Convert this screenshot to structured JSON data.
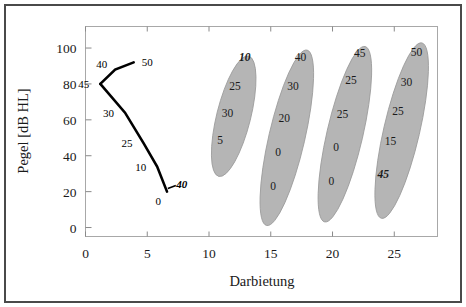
{
  "chart_data": {
    "type": "scatter",
    "title": "",
    "xlabel": "Darbietung",
    "ylabel": "Pegel [dB HL]",
    "xlim": [
      0,
      28.5
    ],
    "ylim": [
      -5,
      112
    ],
    "xticks": [
      0,
      5,
      10,
      15,
      20,
      25
    ],
    "xtick_labels": [
      "0",
      "5",
      "10",
      "15",
      "20",
      "25"
    ],
    "yticks": [
      0,
      20,
      40,
      60,
      80,
      100
    ],
    "ytick_labels": [
      "0",
      "20",
      "40",
      "60",
      "80",
      "100"
    ],
    "grid": false,
    "legend": "none",
    "series": [
      {
        "name": "connected-line",
        "type": "line",
        "marker": "none",
        "points": [
          {
            "x": 1.2,
            "y": 80,
            "label": "45",
            "label_pos": "left"
          },
          {
            "x": 2.4,
            "y": 88,
            "label": "40",
            "label_pos": "above-left"
          },
          {
            "x": 3.9,
            "y": 92,
            "label": "50",
            "label_pos": "right"
          }
        ]
      },
      {
        "name": "descending-line",
        "type": "line",
        "marker": "none",
        "points": [
          {
            "x": 1.2,
            "y": 80,
            "label": "45",
            "label_pos": "left"
          },
          {
            "x": 3.2,
            "y": 64,
            "label": "30",
            "label_pos": "left"
          },
          {
            "x": 4.7,
            "y": 47,
            "label": "25",
            "label_pos": "left"
          },
          {
            "x": 5.8,
            "y": 34,
            "label": "10",
            "label_pos": "left"
          },
          {
            "x": 6.6,
            "y": 20,
            "label": "0",
            "label_pos": "below-left"
          }
        ]
      }
    ],
    "annotations": [
      {
        "text": "40",
        "x": 7.8,
        "y": 24,
        "style": "bold-italic",
        "note": "tick mark right of final point of descending line"
      }
    ],
    "clusters": [
      {
        "name": "cluster-1",
        "center_x": 12.0,
        "center_y": 62,
        "labels": [
          {
            "text": "10",
            "x": 12.9,
            "y": 95,
            "style": "bold-italic"
          },
          {
            "text": "25",
            "x": 12.1,
            "y": 79,
            "style": "normal"
          },
          {
            "text": "30",
            "x": 11.5,
            "y": 64,
            "style": "normal"
          },
          {
            "text": "5",
            "x": 10.9,
            "y": 49,
            "style": "normal"
          }
        ]
      },
      {
        "name": "cluster-2",
        "center_x": 16.3,
        "center_y": 50,
        "labels": [
          {
            "text": "40",
            "x": 17.4,
            "y": 95,
            "style": "normal"
          },
          {
            "text": "30",
            "x": 16.8,
            "y": 79,
            "style": "normal"
          },
          {
            "text": "20",
            "x": 16.1,
            "y": 61,
            "style": "normal"
          },
          {
            "text": "0",
            "x": 15.6,
            "y": 42,
            "style": "normal"
          },
          {
            "text": "0",
            "x": 15.2,
            "y": 23,
            "style": "normal"
          }
        ]
      },
      {
        "name": "cluster-3",
        "center_x": 21.0,
        "center_y": 52,
        "labels": [
          {
            "text": "45",
            "x": 22.2,
            "y": 97,
            "style": "normal"
          },
          {
            "text": "25",
            "x": 21.5,
            "y": 82,
            "style": "normal"
          },
          {
            "text": "25",
            "x": 20.8,
            "y": 63,
            "style": "normal"
          },
          {
            "text": "0",
            "x": 20.3,
            "y": 45,
            "style": "normal"
          },
          {
            "text": "0",
            "x": 19.9,
            "y": 26,
            "style": "normal"
          }
        ]
      },
      {
        "name": "cluster-4",
        "center_x": 25.6,
        "center_y": 54,
        "labels": [
          {
            "text": "50",
            "x": 26.8,
            "y": 98,
            "style": "normal"
          },
          {
            "text": "30",
            "x": 26.0,
            "y": 81,
            "style": "normal"
          },
          {
            "text": "25",
            "x": 25.3,
            "y": 65,
            "style": "normal"
          },
          {
            "text": "15",
            "x": 24.7,
            "y": 48,
            "style": "normal"
          },
          {
            "text": "45",
            "x": 24.1,
            "y": 30,
            "style": "bold-italic"
          }
        ]
      }
    ],
    "colors": {
      "cluster_fill": "#b5b5b5",
      "cluster_stroke": "#9a9a9a",
      "line": "#000000",
      "axis": "#8a8a8a",
      "text": "#1a1a1a",
      "frame": "#4a4a4a",
      "background": "#ffffff"
    }
  }
}
